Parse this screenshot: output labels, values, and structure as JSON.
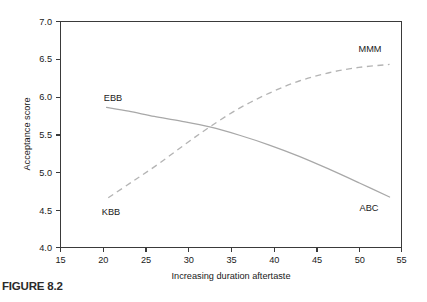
{
  "figure": {
    "caption": "FIGURE 8.2"
  },
  "chart_data": {
    "type": "line",
    "title": "",
    "xlabel": "Increasing duration aftertaste",
    "ylabel": "Acceptance score",
    "xlim": [
      15,
      55
    ],
    "ylim": [
      4.0,
      7.0
    ],
    "xticks": [
      "15",
      "20",
      "25",
      "30",
      "35",
      "40",
      "45",
      "50",
      "55"
    ],
    "yticks": [
      "4.0",
      "4.5",
      "5.0",
      "5.5",
      "6.0",
      "6.5",
      "7.0"
    ],
    "grid": false,
    "legend": "inline-endpoint-labels",
    "series": [
      {
        "name": "EBB-ABC",
        "style": "solid",
        "color": "#a8a8a8",
        "start_label": "EBB",
        "end_label": "ABC",
        "x": [
          20.4,
          23.0,
          26.0,
          29.0,
          32.5,
          36.0,
          39.5,
          43.0,
          46.5,
          50.0,
          53.6
        ],
        "y": [
          5.86,
          5.81,
          5.74,
          5.68,
          5.6,
          5.49,
          5.36,
          5.21,
          5.04,
          4.86,
          4.67
        ]
      },
      {
        "name": "KBB-MMM",
        "style": "dashed",
        "color": "#b4b4b4",
        "start_label": "KBB",
        "end_label": "MMM",
        "x": [
          20.6,
          23.5,
          26.5,
          29.5,
          32.5,
          36.0,
          39.5,
          43.0,
          46.5,
          50.0,
          53.6
        ],
        "y": [
          4.66,
          4.88,
          5.11,
          5.36,
          5.6,
          5.85,
          6.05,
          6.21,
          6.32,
          6.39,
          6.43
        ]
      }
    ],
    "annotations": [
      {
        "text": "EBB",
        "x": 21.2,
        "y": 6.02
      },
      {
        "text": "KBB",
        "x": 21.0,
        "y": 4.52
      },
      {
        "text": "MMM",
        "x": 49.3,
        "y": 6.58
      },
      {
        "text": "ABC",
        "x": 49.2,
        "y": 4.56
      }
    ]
  }
}
